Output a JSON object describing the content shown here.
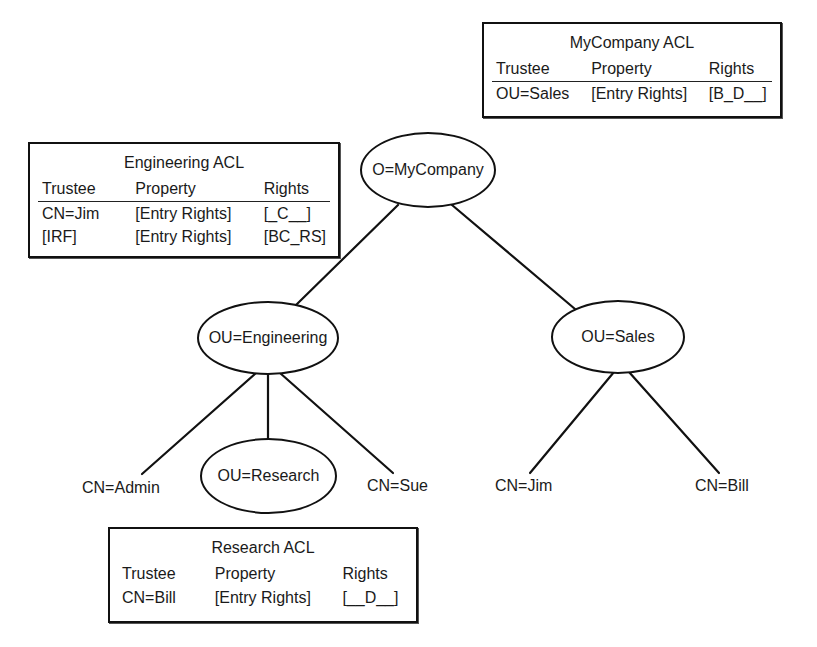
{
  "diagram": {
    "nodes": {
      "root": "O=MyCompany",
      "engineering": "OU=Engineering",
      "sales": "OU=Sales",
      "research": "OU=Research",
      "admin": "CN=Admin",
      "sue": "CN=Sue",
      "jim": "CN=Jim",
      "bill": "CN=Bill"
    },
    "edges": [
      {
        "from": "O=MyCompany",
        "to": "OU=Engineering"
      },
      {
        "from": "O=MyCompany",
        "to": "OU=Sales"
      },
      {
        "from": "OU=Engineering",
        "to": "CN=Admin"
      },
      {
        "from": "OU=Engineering",
        "to": "OU=Research"
      },
      {
        "from": "OU=Engineering",
        "to": "CN=Sue"
      },
      {
        "from": "OU=Sales",
        "to": "CN=Jim"
      },
      {
        "from": "OU=Sales",
        "to": "CN=Bill"
      }
    ],
    "acls": {
      "mycompany": {
        "title": "MyCompany ACL",
        "headers": [
          "Trustee",
          "Property",
          "Rights"
        ],
        "rows": [
          [
            "OU=Sales",
            "[Entry Rights]",
            "[B_D__]"
          ]
        ]
      },
      "engineering": {
        "title": "Engineering ACL",
        "headers": [
          "Trustee",
          "Property",
          "Rights"
        ],
        "rows": [
          [
            "CN=Jim",
            "[Entry Rights]",
            "[_C__]"
          ],
          [
            "[IRF]",
            "[Entry Rights]",
            "[BC_RS]"
          ]
        ]
      },
      "research": {
        "title": "Research ACL",
        "headers": [
          "Trustee",
          "Property",
          "Rights"
        ],
        "rows": [
          [
            "CN=Bill",
            "[Entry Rights]",
            "[__D__]"
          ]
        ]
      }
    }
  }
}
